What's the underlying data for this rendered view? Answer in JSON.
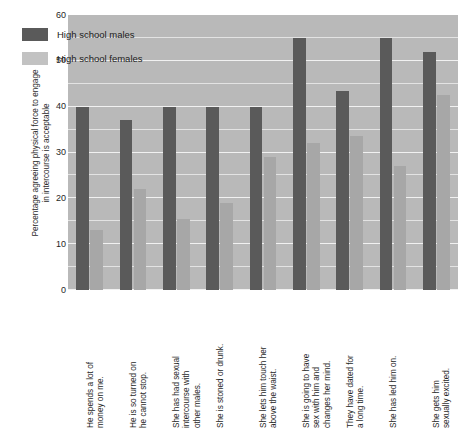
{
  "chart_data": {
    "type": "bar",
    "title": "",
    "subtitle": "",
    "xlabel": "",
    "ylabel": "Percentage agreeing physical force to engage in intercourse is acceptable",
    "ylabel_lines": [
      "Percentage agreeing physical force to engage",
      "in intercourse is acceptable"
    ],
    "ylim": [
      0,
      60
    ],
    "yticks": [
      0,
      10,
      20,
      30,
      40,
      50,
      60
    ],
    "ytick_labels": [
      "0",
      "10",
      "20",
      "30",
      "40",
      "50",
      "60"
    ],
    "grid": true,
    "grid_axis": "y",
    "legend_position": "upper-left-inside",
    "categories": [
      "He spends a lot of money on me.",
      "He is so turned on he cannot stop.",
      "She has had sexual intercourse with other males.",
      "She is stoned or drunk.",
      "She lets him touch her above the waist.",
      "She is going to have sex with him and changes her mind.",
      "They have dated for a long time.",
      "She has led him on.",
      "She gets him sexually excited."
    ],
    "category_lines": [
      [
        "He spends a lot of",
        "money on me."
      ],
      [
        "He is so turned on",
        "he cannot stop."
      ],
      [
        "She has had sexual",
        "intercourse with",
        "other males."
      ],
      [
        "She is stoned or drunk."
      ],
      [
        "She lets him touch her",
        "above the waist."
      ],
      [
        "She is going to have",
        "sex with him and",
        "changes her mind."
      ],
      [
        "They have dated for",
        "a long time."
      ],
      [
        "She has led him on."
      ],
      [
        "She gets him",
        "sexually excited."
      ]
    ],
    "series": [
      {
        "name": "High school males",
        "color": "#5a5a5a",
        "values": [
          40,
          37,
          40,
          40,
          40,
          55,
          43.5,
          55,
          52
        ]
      },
      {
        "name": "High school females",
        "color": "#a7a7a7",
        "values": [
          13,
          22,
          15.5,
          19,
          29,
          32,
          33.5,
          27,
          42.5
        ]
      }
    ]
  },
  "legend": {
    "items": [
      {
        "label": "High school males",
        "swatch": "male"
      },
      {
        "label": "High school females",
        "swatch": "female"
      }
    ]
  }
}
